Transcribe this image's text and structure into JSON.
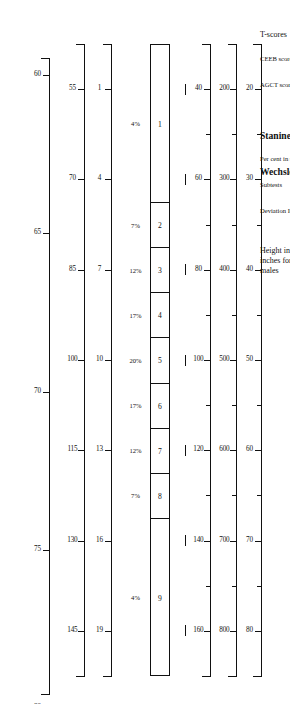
{
  "figure": {
    "orientation": "rotated-90",
    "ink_color": "#111111",
    "background": "#ffffff"
  },
  "chart_data": {
    "type": "table",
    "title": "",
    "subtitle": "",
    "xlabel": "",
    "ylabel": "",
    "grid": false,
    "legend_position": "none",
    "axis_domain_sd": [
      -3.0,
      3.0
    ],
    "scales": [
      {
        "name": "t-scores",
        "label": "T-scores",
        "label_style": "normal",
        "ticks": [
          20,
          30,
          40,
          50,
          60,
          70,
          80
        ],
        "tick_labels": [
          "20",
          "30",
          "40",
          "50",
          "60",
          "70",
          "80"
        ],
        "minor_ticks": [
          15,
          25,
          35,
          45,
          55,
          65,
          75,
          85
        ],
        "sd_per_unit": 10,
        "mean": 50,
        "range_sd": [
          -3.5,
          3.5
        ]
      },
      {
        "name": "ceeb-scores",
        "label": "CEEB scores",
        "label_style": "small",
        "ticks": [
          200,
          300,
          400,
          500,
          600,
          700,
          800
        ],
        "tick_labels": [
          "200",
          "300",
          "400",
          "500",
          "600",
          "700",
          "800"
        ],
        "minor_ticks": [
          150,
          250,
          350,
          450,
          550,
          650,
          750,
          850
        ],
        "sd_per_unit": 100,
        "mean": 500,
        "range_sd": [
          -3.5,
          3.5
        ]
      },
      {
        "name": "agct-scores",
        "label": "AGCT scores",
        "label_style": "small",
        "ticks": [
          40,
          60,
          80,
          100,
          120,
          140,
          160
        ],
        "tick_labels": [
          "40",
          "60",
          "80",
          "100",
          "120",
          "140",
          "160"
        ],
        "minor_ticks": [
          30,
          50,
          70,
          90,
          110,
          130,
          150,
          170
        ],
        "sd_per_unit": 20,
        "mean": 100,
        "range_sd": [
          -3.5,
          3.5
        ]
      },
      {
        "name": "dash-scale",
        "label": "",
        "label_style": "none",
        "ticks": [],
        "tick_labels": [],
        "marks_at_sd": [
          -3,
          -2,
          -1,
          0,
          1,
          2,
          3
        ],
        "range_sd": [
          -3.5,
          3.5
        ]
      },
      {
        "name": "wechsler-subtests",
        "label": "Subtests",
        "label_style": "small",
        "group_label": "Wechsler Scales",
        "ticks": [
          1,
          4,
          7,
          10,
          13,
          16,
          19
        ],
        "tick_labels": [
          "1",
          "4",
          "7",
          "10",
          "13",
          "16",
          "19"
        ],
        "sd_per_unit": 3,
        "mean": 10,
        "range_sd": [
          -3.5,
          3.5
        ]
      },
      {
        "name": "deviation-iqs",
        "label": "Deviation IQs",
        "label_style": "small",
        "ticks": [
          55,
          70,
          85,
          100,
          115,
          130,
          145
        ],
        "tick_labels": [
          "55",
          "70",
          "85",
          "100",
          "115",
          "130",
          "145"
        ],
        "sd_per_unit": 15,
        "mean": 100,
        "range_sd": [
          -3.5,
          3.5
        ]
      },
      {
        "name": "height-males",
        "label": "Height in\ninches for\nmales",
        "label_style": "normal-multiline",
        "ticks": [
          50,
          55,
          60,
          65,
          70,
          75,
          80,
          85,
          90
        ],
        "tick_labels": [
          "50",
          "55",
          "60",
          "65",
          "70",
          "75",
          "80",
          "85",
          "90"
        ],
        "sd_per_unit": 2.85,
        "mean": 69,
        "range_sd": [
          -3.35,
          3.7
        ]
      }
    ],
    "stanines": {
      "label": "Stanines",
      "percent_label": "Per cent in stanine",
      "categories": [
        1,
        2,
        3,
        4,
        5,
        6,
        7,
        8,
        9
      ],
      "labels": [
        "1",
        "2",
        "3",
        "4",
        "5",
        "6",
        "7",
        "8",
        "9"
      ],
      "values": [
        4,
        7,
        12,
        17,
        20,
        17,
        12,
        7,
        4
      ],
      "percent_labels": [
        "4%",
        "7%",
        "12%",
        "17%",
        "20%",
        "17%",
        "12%",
        "7%",
        "4%"
      ],
      "band_lower_sd": [
        -3.5,
        -1.75,
        -1.25,
        -0.75,
        -0.25,
        0.25,
        0.75,
        1.25,
        1.75
      ],
      "band_upper_sd": [
        -1.75,
        -1.25,
        -0.75,
        -0.25,
        0.25,
        0.75,
        1.25,
        1.75,
        3.5
      ]
    }
  }
}
